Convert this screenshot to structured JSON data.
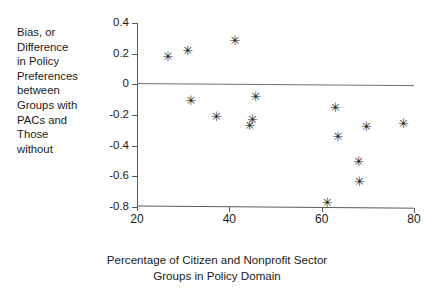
{
  "chart_data": {
    "type": "scatter",
    "title": "",
    "xlabel": "Percentage of Citizen and Nonprofit Sector\nGroups in Policy Domain",
    "ylabel": "Bias, or\nDifference\nin Policy\nPreferences\nbetween\nGroups with\nPACs and\nThose\nwithout",
    "xlim": [
      20,
      80
    ],
    "ylim": [
      -0.8,
      0.4
    ],
    "xticks": [
      20,
      40,
      60,
      80
    ],
    "xtick_labels": [
      "20",
      "40",
      "60",
      "80"
    ],
    "yticks": [
      0.4,
      0.2,
      0,
      -0.2,
      -0.4,
      -0.6,
      -0.8
    ],
    "ytick_labels": [
      "0.4",
      "0.2",
      "0",
      "-0.2",
      "-0.4",
      "-0.6",
      "-0.8"
    ],
    "grid": false,
    "legend": null,
    "marker": "asterisk",
    "marker_glyph": "✳",
    "marker_color": "#1a1a1a",
    "reference_line": {
      "y": 0,
      "color": "#595959",
      "style": "solid"
    },
    "axis_color": "#595959",
    "points": [
      {
        "x": 26.5,
        "y": 0.18
      },
      {
        "x": 30.8,
        "y": 0.225
      },
      {
        "x": 41.0,
        "y": 0.29
      },
      {
        "x": 31.5,
        "y": -0.105
      },
      {
        "x": 37.0,
        "y": -0.205
      },
      {
        "x": 44.2,
        "y": -0.265
      },
      {
        "x": 44.8,
        "y": -0.225
      },
      {
        "x": 45.5,
        "y": -0.07
      },
      {
        "x": 61.0,
        "y": -0.76
      },
      {
        "x": 62.8,
        "y": -0.14
      },
      {
        "x": 63.3,
        "y": -0.33
      },
      {
        "x": 67.8,
        "y": -0.49
      },
      {
        "x": 68.0,
        "y": -0.62
      },
      {
        "x": 69.5,
        "y": -0.26
      },
      {
        "x": 77.5,
        "y": -0.24
      }
    ]
  }
}
